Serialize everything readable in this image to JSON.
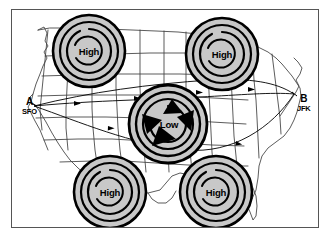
{
  "diagram": {
    "background_color": "#ffffff",
    "border_color": "#555555",
    "map_outline_color": "#3b3b3b",
    "system_fill_color": "#c8c8c8",
    "system_ring_color": "#000000",
    "route_color": "#000000"
  },
  "pressure_systems": [
    {
      "id": "high-nw",
      "label": "High",
      "type": "high",
      "cx": 89,
      "cy": 51,
      "r": 36
    },
    {
      "id": "high-ne",
      "label": "High",
      "type": "high",
      "cx": 222,
      "cy": 54,
      "r": 36
    },
    {
      "id": "high-sw",
      "label": "High",
      "type": "high",
      "cx": 110,
      "cy": 192,
      "r": 36
    },
    {
      "id": "high-se",
      "label": "High",
      "type": "high",
      "cx": 216,
      "cy": 192,
      "r": 36
    },
    {
      "id": "low-center",
      "label": "Low",
      "type": "low",
      "cx": 168,
      "cy": 124,
      "r": 39
    }
  ],
  "endpoints": [
    {
      "id": "origin",
      "letter": "A",
      "code": "SFO",
      "x": 31,
      "y": 104
    },
    {
      "id": "destination",
      "letter": "B",
      "code": "JFK",
      "x": 296,
      "y": 101
    }
  ],
  "wind_arrows": {
    "count": 4,
    "rotation": "counterclockwise",
    "description": "cyclonic inflow arrows around Low"
  },
  "routes": [
    {
      "id": "route-north",
      "description": "northern great-circle track from SFO to JFK"
    },
    {
      "id": "route-direct",
      "description": "direct track from SFO to JFK through the Low"
    },
    {
      "id": "route-south",
      "description": "southern deviation track from SFO to JFK"
    }
  ]
}
